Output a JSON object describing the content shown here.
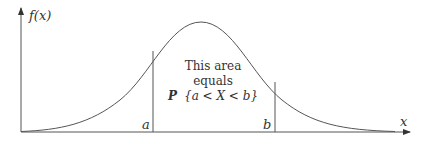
{
  "diagram": {
    "y_axis_label": "f(x)",
    "x_axis_label": "x",
    "left_bound_label": "a",
    "right_bound_label": "b",
    "annotation": {
      "line1": "This area",
      "line2": "equals",
      "line3_prefix": "P",
      "line3_expr": "{a < X < b}"
    },
    "curve": "bell-shaped density curve",
    "colors": {
      "line": "#555555",
      "text": "#333333",
      "background": "#ffffff"
    }
  }
}
